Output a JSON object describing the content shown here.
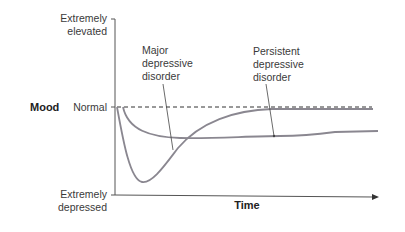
{
  "diagram": {
    "y_axis": {
      "title": "Mood",
      "top_label_line1": "Extremely",
      "top_label_line2": "elevated",
      "middle_label": "Normal",
      "bottom_label_line1": "Extremely",
      "bottom_label_line2": "depressed"
    },
    "x_axis": {
      "title": "Time"
    },
    "curves": [
      {
        "name": "Major depressive disorder",
        "label_line1": "Major",
        "label_line2": "depressive",
        "label_line3": "disorder",
        "description": "Sharp drop to near extremely depressed, then recovers back to normal"
      },
      {
        "name": "Persistent depressive disorder",
        "label_line1": "Persistent",
        "label_line2": "depressive",
        "label_line3": "disorder",
        "description": "Moderate drop below normal that persists over time"
      }
    ],
    "colors": {
      "curve": "#8a8790",
      "axis": "#555555",
      "dashed_normal": "#333333"
    }
  }
}
